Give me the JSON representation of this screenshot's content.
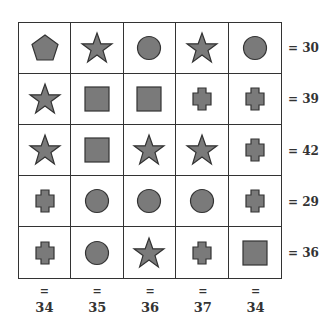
{
  "puzzle": {
    "shape_color": "#7a7a7a",
    "outline_color": "#333333",
    "grid": [
      [
        "pentagon",
        "star",
        "circle",
        "star",
        "circle"
      ],
      [
        "star",
        "square",
        "square",
        "cross",
        "cross"
      ],
      [
        "star",
        "square",
        "star",
        "star",
        "cross"
      ],
      [
        "cross",
        "circle",
        "circle",
        "circle",
        "cross"
      ],
      [
        "cross",
        "circle",
        "star",
        "cross",
        "square"
      ]
    ],
    "row_sums": [
      "= 30",
      "= 39",
      "= 42",
      "= 29",
      "= 36"
    ],
    "col_eq": [
      "=",
      "=",
      "=",
      "=",
      "="
    ],
    "col_sums": [
      "34",
      "35",
      "36",
      "37",
      "34"
    ]
  }
}
